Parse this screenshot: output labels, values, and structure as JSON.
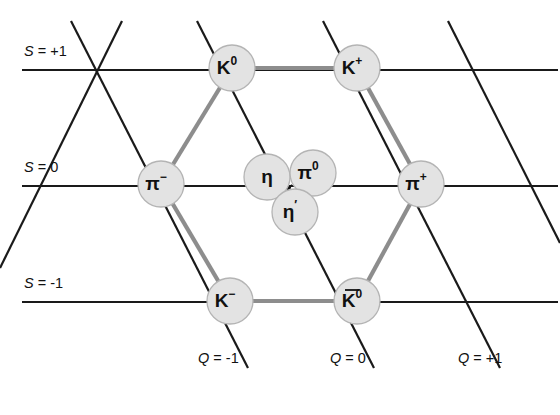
{
  "colors": {
    "background": "#ffffff",
    "axis_line": "#1a1a1a",
    "bond_line": "#8d8d8d",
    "node_fill": "#e3e3e3",
    "node_stroke": "#b4b4b4",
    "text": "#111111"
  },
  "strangeness_axes": [
    {
      "id": "s-plus-1",
      "label": "S = +1",
      "sym": "S",
      "rest": " = +1",
      "y": 70,
      "label_x": 24,
      "label_y": 56,
      "x1": 22,
      "x2": 558
    },
    {
      "id": "s-zero",
      "label": "S = 0",
      "sym": "S",
      "rest": " = 0",
      "y": 186,
      "label_x": 24,
      "label_y": 172,
      "x1": 22,
      "x2": 558
    },
    {
      "id": "s-minus-1",
      "label": "S = -1",
      "sym": "S",
      "rest": " = -1",
      "y": 302,
      "label_x": 24,
      "label_y": 288,
      "x1": 22,
      "x2": 558
    }
  ],
  "charge_axes": [
    {
      "id": "q-minus-1",
      "label": "Q = -1",
      "sym": "Q",
      "rest": " = -1",
      "label_x": 198,
      "label_y": 363,
      "x1": 71,
      "y1": 21,
      "x2": 248,
      "y2": 368
    },
    {
      "id": "q-zero",
      "label": "Q = 0",
      "sym": "Q",
      "rest": " = 0",
      "label_x": 330,
      "label_y": 363,
      "x1": 197,
      "y1": 21,
      "x2": 374,
      "y2": 368
    },
    {
      "id": "q-plus-1",
      "label": "Q = +1",
      "sym": "Q",
      "rest": " = +1",
      "label_x": 458,
      "label_y": 363,
      "x1": 323,
      "y1": 21,
      "x2": 500,
      "y2": 368
    }
  ],
  "extra_diagonals": [
    {
      "id": "diag-upper-right-1",
      "x1": 448,
      "y1": 21,
      "x2": 560,
      "y2": 243
    },
    {
      "id": "diag-lower-left-1",
      "x1": 122,
      "y1": 21,
      "x2": 0,
      "y2": 268
    }
  ],
  "nodes": [
    {
      "id": "k0",
      "name": "K0",
      "base": "K",
      "sup": "0",
      "overline": false,
      "x": 232,
      "y": 68,
      "r": 23
    },
    {
      "id": "kplus",
      "name": "K+",
      "base": "K",
      "sup": "+",
      "overline": false,
      "x": 357,
      "y": 68,
      "r": 23
    },
    {
      "id": "piminus",
      "name": "pi-",
      "base": "π",
      "sup": "−",
      "overline": false,
      "x": 161,
      "y": 184,
      "r": 23
    },
    {
      "id": "eta",
      "name": "eta",
      "base": "η",
      "sup": "",
      "overline": false,
      "x": 267,
      "y": 177,
      "r": 23
    },
    {
      "id": "pi0",
      "name": "pi0",
      "base": "π",
      "sup": "0",
      "overline": false,
      "x": 313,
      "y": 173,
      "r": 23
    },
    {
      "id": "etaprime",
      "name": "eta-prime",
      "base": "η",
      "sup": "′",
      "overline": false,
      "x": 295,
      "y": 212,
      "r": 23
    },
    {
      "id": "piplus",
      "name": "pi+",
      "base": "π",
      "sup": "+",
      "overline": false,
      "x": 421,
      "y": 184,
      "r": 23
    },
    {
      "id": "kminus",
      "name": "K-",
      "base": "K",
      "sup": "−",
      "overline": false,
      "x": 230,
      "y": 301,
      "r": 23
    },
    {
      "id": "k0bar",
      "name": "K0bar",
      "base": "K",
      "sup": "0",
      "overline": true,
      "x": 357,
      "y": 301,
      "r": 23
    }
  ],
  "bonds": [
    {
      "id": "bond-k0-kplus",
      "from": "k0",
      "to": "kplus"
    },
    {
      "id": "bond-k0-piminus",
      "from": "k0",
      "to": "piminus"
    },
    {
      "id": "bond-kplus-piplus",
      "from": "kplus",
      "to": "piplus"
    },
    {
      "id": "bond-piminus-kminus",
      "from": "piminus",
      "to": "kminus"
    },
    {
      "id": "bond-piplus-k0bar",
      "from": "piplus",
      "to": "k0bar"
    },
    {
      "id": "bond-kminus-k0bar",
      "from": "kminus",
      "to": "k0bar"
    }
  ],
  "center_arrow": {
    "x": 288,
    "y": 186
  }
}
